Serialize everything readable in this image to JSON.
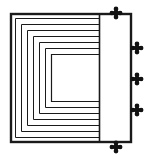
{
  "figure": {
    "title": "Nested open-right rectangles with edge markers",
    "width": 152,
    "height": 159,
    "background_color": "#ffffff",
    "stroke_color": "#1a1a1a",
    "marker_color": "#111111"
  },
  "outer_frame": {
    "name": "outer-rectangle",
    "x": 11,
    "y": 14,
    "width": 120,
    "height": 128,
    "stroke_width": 2.4,
    "fill": "none"
  },
  "divider": {
    "name": "vertical-divider",
    "x": 99.5,
    "y1": 14,
    "y2": 142,
    "stroke_width": 1.6
  },
  "nested_paths": {
    "description": "Concentric C-shaped (open to the right) rectangles nested inside the outer frame",
    "count": 7,
    "right_end_x": 99.5,
    "items": [
      {
        "label": "ring-1",
        "left": 15.5,
        "top": 18.5,
        "bottom": 137.5,
        "stroke_width": 1.0
      },
      {
        "label": "ring-2",
        "left": 21.5,
        "top": 24.5,
        "bottom": 131.5,
        "stroke_width": 1.0
      },
      {
        "label": "ring-3",
        "left": 27.5,
        "top": 30.5,
        "bottom": 125.5,
        "stroke_width": 1.0
      },
      {
        "label": "ring-4",
        "left": 33.5,
        "top": 36.5,
        "bottom": 119.5,
        "stroke_width": 1.0
      },
      {
        "label": "ring-5",
        "left": 39.5,
        "top": 42.5,
        "bottom": 113.5,
        "stroke_width": 1.0
      },
      {
        "label": "ring-6",
        "left": 45.5,
        "top": 48.5,
        "bottom": 107.5,
        "stroke_width": 1.0
      },
      {
        "label": "ring-7",
        "left": 51.5,
        "top": 54.5,
        "bottom": 101.5,
        "stroke_width": 1.2
      }
    ]
  },
  "markers": {
    "shape": "cross-pommee",
    "size": 11,
    "items": [
      {
        "label": "marker-top",
        "name": "marker-top",
        "x": 116,
        "y": 13
      },
      {
        "label": "marker-right-upper",
        "name": "marker-right-upper",
        "x": 137,
        "y": 48
      },
      {
        "label": "marker-right-middle",
        "name": "marker-right-middle",
        "x": 137,
        "y": 79
      },
      {
        "label": "marker-right-lower",
        "name": "marker-right-lower",
        "x": 137,
        "y": 110
      },
      {
        "label": "marker-bottom",
        "name": "marker-bottom",
        "x": 116,
        "y": 147
      }
    ]
  }
}
